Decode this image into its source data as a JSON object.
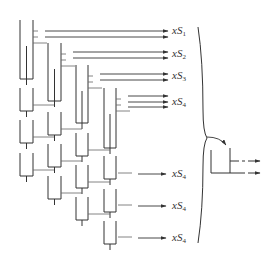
{
  "diagram": {
    "type": "tray-stacking-schematic",
    "line_color": "#333333",
    "thin_line_color": "#555555",
    "columns": [
      {
        "x_left": 20,
        "x_right": 33,
        "tall_top": 20,
        "tall_bottom": 79,
        "small_units": [
          88,
          120,
          153
        ]
      },
      {
        "x_left": 48,
        "x_right": 61,
        "tall_top": 43,
        "tall_bottom": 101,
        "small_units": [
          112,
          144,
          176
        ]
      },
      {
        "x_left": 76,
        "x_right": 88,
        "tall_top": 65,
        "tall_bottom": 123,
        "small_units": [
          133,
          165,
          197
        ]
      },
      {
        "x_left": 104,
        "x_right": 116,
        "tall_top": 88,
        "tall_bottom": 148,
        "small_units": [
          156,
          189,
          221
        ]
      }
    ],
    "outputs": [
      {
        "label_base": "xS",
        "subscript": "1",
        "y": 31
      },
      {
        "label_base": "xS",
        "subscript": "2",
        "y": 54
      },
      {
        "label_base": "xS",
        "subscript": "3",
        "y": 76
      },
      {
        "label_base": "xS",
        "subscript": "4",
        "y": 101
      },
      {
        "label_base": "xS",
        "subscript": "4",
        "y": 174
      },
      {
        "label_base": "xS",
        "subscript": "4",
        "y": 206
      },
      {
        "label_base": "xS",
        "subscript": "4",
        "y": 238
      }
    ],
    "brace": {
      "x": 198,
      "top": 27,
      "bottom": 243
    },
    "result_unit": {
      "x_left": 211,
      "x_right": 230,
      "top": 148,
      "bottom": 173,
      "arrows_y": [
        161,
        173
      ]
    }
  },
  "labels": {
    "out1": {
      "base": "xS",
      "sub": "1"
    },
    "out2": {
      "base": "xS",
      "sub": "2"
    },
    "out3": {
      "base": "xS",
      "sub": "3"
    },
    "out4a": {
      "base": "xS",
      "sub": "4"
    },
    "out4b": {
      "base": "xS",
      "sub": "4"
    },
    "out4c": {
      "base": "xS",
      "sub": "4"
    },
    "out4d": {
      "base": "xS",
      "sub": "4"
    }
  }
}
